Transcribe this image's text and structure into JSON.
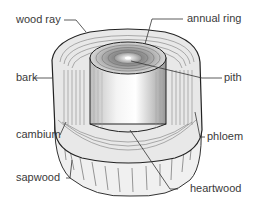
{
  "diagram": {
    "labels": {
      "wood_ray": "wood ray",
      "annual_ring": "annual ring",
      "bark": "bark",
      "pith": "pith",
      "cambium": "cambium",
      "phloem": "phloem",
      "sapwood": "sapwood",
      "heartwood": "heartwood"
    }
  }
}
